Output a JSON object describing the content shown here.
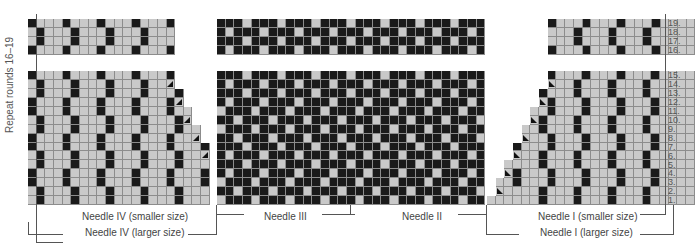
{
  "chart": {
    "side_label": "Repeat rounds 16–19",
    "row_numbers": [
      "19.",
      "18.",
      "17.",
      "16.",
      "15.",
      "14.",
      "13.",
      "12.",
      "11.",
      "10.",
      "9.",
      "8.",
      "7.",
      "6.",
      "5.",
      "4.",
      "3.",
      "2.",
      "1."
    ],
    "labels": {
      "needle_iv_small": "Needle IV (smaller size)",
      "needle_iv_large": "Needle IV (larger size)",
      "needle_iii": "Needle III",
      "needle_ii": "Needle II",
      "needle_i_small": "Needle I (smaller size)",
      "needle_i_large": "Needle I (larger size)"
    },
    "colors": {
      "light": "#c9c9c9",
      "dark": "#1a1a1a",
      "grid": "#8c8c8c"
    }
  }
}
